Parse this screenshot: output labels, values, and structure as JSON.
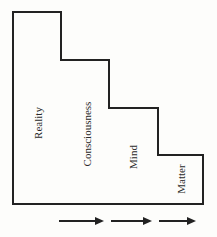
{
  "diagram": {
    "type": "staircase",
    "levels": [
      {
        "label": "Reality"
      },
      {
        "label": "Consciousness"
      },
      {
        "label": "Mind"
      },
      {
        "label": "Matter"
      }
    ],
    "arrows": 3,
    "colors": {
      "line": "#222222",
      "background": "#fdfdfb"
    }
  }
}
